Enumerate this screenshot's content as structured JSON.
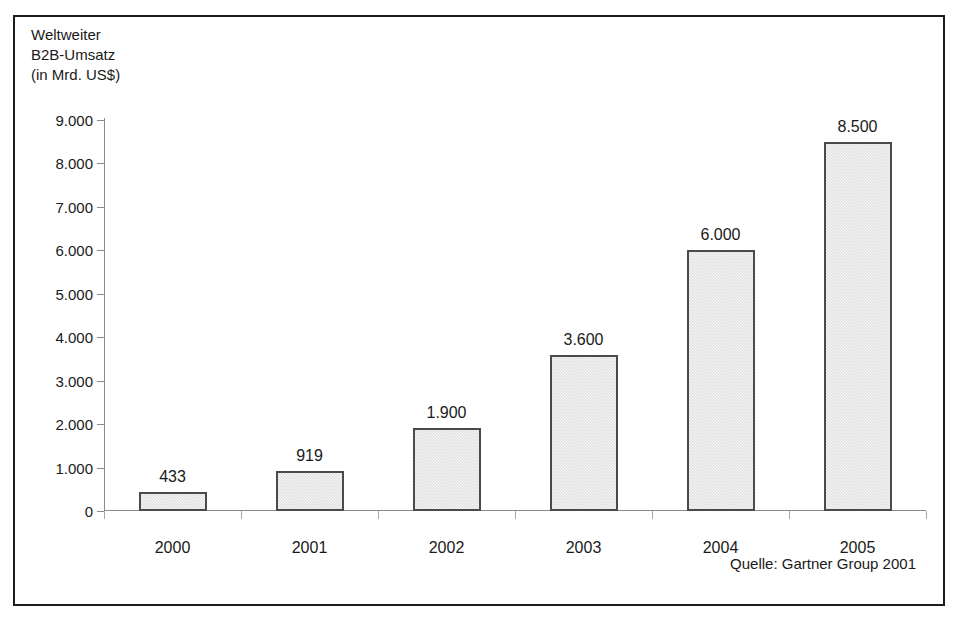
{
  "chart_data": {
    "type": "bar",
    "title": "Weltweiter B2B-Umsatz (in Mrd. US$)",
    "title_lines": [
      "Weltweiter",
      "B2B-Umsatz",
      "(in Mrd. US$)"
    ],
    "categories": [
      "2000",
      "2001",
      "2002",
      "2003",
      "2004",
      "2005"
    ],
    "values": [
      433,
      919,
      1900,
      3600,
      6000,
      8500
    ],
    "value_labels": [
      "433",
      "919",
      "1.900",
      "3.600",
      "6.000",
      "8.500"
    ],
    "xlabel": "",
    "ylabel": "",
    "ylim": [
      0,
      9000
    ],
    "ytick_values": [
      0,
      1000,
      2000,
      3000,
      4000,
      5000,
      6000,
      7000,
      8000,
      9000
    ],
    "ytick_labels": [
      "0",
      "1.000",
      "2.000",
      "3.000",
      "4.000",
      "5.000",
      "6.000",
      "7.000",
      "8.000",
      "9.000"
    ],
    "grid": false,
    "legend": null,
    "annotations": [
      "Quelle: Gartner Group 2001"
    ],
    "series": [
      {
        "name": "Weltweiter B2B-Umsatz",
        "values": [
          433,
          919,
          1900,
          3600,
          6000,
          8500
        ]
      }
    ],
    "colors": {
      "bar_fill": "#e1e1e1",
      "bar_border": "#4a4a4a",
      "axis": "#8c8c8c",
      "frame": "#1c1c1c",
      "text": "#1a1a1a"
    }
  },
  "source_note": "Quelle: Gartner Group 2001"
}
